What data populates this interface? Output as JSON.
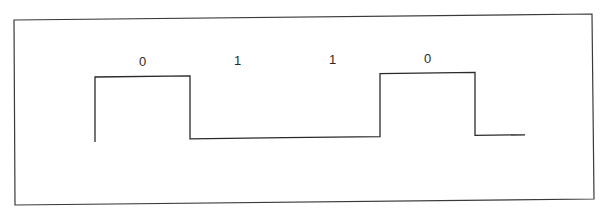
{
  "diagram": {
    "title": "",
    "bits": [
      "0",
      "1",
      "1",
      "0"
    ],
    "waveform_levels": [
      "high",
      "low",
      "low",
      "high"
    ],
    "trailing_level": "low",
    "colors": {
      "line": "#2a2a2a",
      "frame": "#3a3a3a",
      "background": "#ffffff"
    }
  }
}
